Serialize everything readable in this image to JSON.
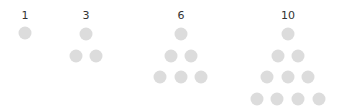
{
  "dot_color": "#dcdcdc",
  "groups": [
    {
      "label": "1",
      "label_pos": [
        25,
        15
      ],
      "dots": [
        [
          25,
          33
        ]
      ]
    },
    {
      "label": "3",
      "label_pos": [
        86,
        15
      ],
      "dots": [
        [
          86,
          34
        ],
        [
          76,
          56
        ],
        [
          96,
          56
        ]
      ]
    },
    {
      "label": "6",
      "label_pos": [
        181,
        15
      ],
      "dots": [
        [
          181,
          34
        ],
        [
          171,
          56
        ],
        [
          191,
          56
        ],
        [
          160,
          77
        ],
        [
          181,
          77
        ],
        [
          201,
          77
        ]
      ]
    },
    {
      "label": "10",
      "label_pos": [
        288,
        15
      ],
      "dots": [
        [
          288,
          34
        ],
        [
          278,
          56
        ],
        [
          298,
          56
        ],
        [
          267,
          77
        ],
        [
          288,
          77
        ],
        [
          308,
          77
        ],
        [
          257,
          99
        ],
        [
          277,
          99
        ],
        [
          298,
          99
        ],
        [
          319,
          99
        ]
      ]
    }
  ]
}
